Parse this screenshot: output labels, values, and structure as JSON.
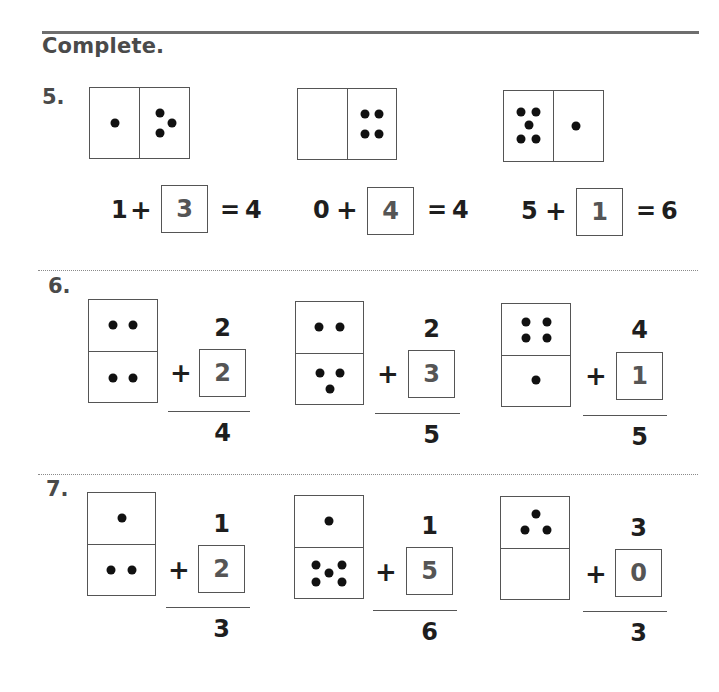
{
  "title": "Complete.",
  "questions": [
    {
      "number": "5.",
      "items": [
        {
          "domino": {
            "orientation": "horizontal",
            "left_pips": 1,
            "right_pips": 3
          },
          "equation": {
            "addend1": "1",
            "operator": "+",
            "answer": "3",
            "equals": "=",
            "sum": "4"
          }
        },
        {
          "domino": {
            "orientation": "horizontal",
            "left_pips": 0,
            "right_pips": 4
          },
          "equation": {
            "addend1": "0",
            "operator": "+",
            "answer": "4",
            "equals": "=",
            "sum": "4"
          }
        },
        {
          "domino": {
            "orientation": "horizontal",
            "left_pips": 5,
            "right_pips": 1
          },
          "equation": {
            "addend1": "5",
            "operator": "+",
            "answer": "1",
            "equals": "=",
            "sum": "6"
          }
        }
      ]
    },
    {
      "number": "6.",
      "items": [
        {
          "domino": {
            "orientation": "vertical",
            "top_pips": 2,
            "bottom_pips": 2
          },
          "equation": {
            "top": "2",
            "operator": "+",
            "answer": "2",
            "sum": "4"
          }
        },
        {
          "domino": {
            "orientation": "vertical",
            "top_pips": 2,
            "bottom_pips": 3
          },
          "equation": {
            "top": "2",
            "operator": "+",
            "answer": "3",
            "sum": "5"
          }
        },
        {
          "domino": {
            "orientation": "vertical",
            "top_pips": 4,
            "bottom_pips": 1
          },
          "equation": {
            "top": "4",
            "operator": "+",
            "answer": "1",
            "sum": "5"
          }
        }
      ]
    },
    {
      "number": "7.",
      "items": [
        {
          "domino": {
            "orientation": "vertical",
            "top_pips": 1,
            "bottom_pips": 2
          },
          "equation": {
            "top": "1",
            "operator": "+",
            "answer": "2",
            "sum": "3"
          }
        },
        {
          "domino": {
            "orientation": "vertical",
            "top_pips": 1,
            "bottom_pips": 5
          },
          "equation": {
            "top": "1",
            "operator": "+",
            "answer": "5",
            "sum": "6"
          }
        },
        {
          "domino": {
            "orientation": "vertical",
            "top_pips": 3,
            "bottom_pips": 0
          },
          "equation": {
            "top": "3",
            "operator": "+",
            "answer": "0",
            "sum": "3"
          }
        }
      ]
    }
  ]
}
